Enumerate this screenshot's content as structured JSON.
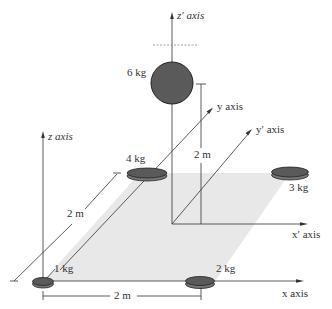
{
  "figure": {
    "axes": {
      "z": "z axis",
      "z_prime": "z′ axis",
      "y": "y axis",
      "y_prime": "y′ axis",
      "x": "x axis",
      "x_prime": "x′ axis"
    },
    "masses": [
      {
        "label": "6 kg",
        "shape": "sphere"
      },
      {
        "label": "4 kg",
        "shape": "disk"
      },
      {
        "label": "3 kg",
        "shape": "disk"
      },
      {
        "label": "1 kg",
        "shape": "disk"
      },
      {
        "label": "2 kg",
        "shape": "disk"
      }
    ],
    "dimensions": {
      "vertical": "2 m",
      "diagonal": "2 m",
      "horizontal": "2 m"
    },
    "colors": {
      "mass_fill": "#5a5a5a",
      "plane_fill": "#e6e6e6",
      "line": "#333333"
    }
  }
}
